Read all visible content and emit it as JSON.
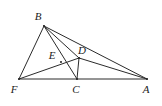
{
  "figure": {
    "kind": "geometry-diagram",
    "width": 162,
    "height": 106,
    "background_color": "#ffffff",
    "stroke_color": "#2b2b2b",
    "label_color": "#1c1c1c",
    "points": [
      {
        "id": "B",
        "label": "B",
        "x": 44,
        "y": 26,
        "label_x": 38,
        "label_y": 16
      },
      {
        "id": "F",
        "label": "F",
        "x": 19,
        "y": 79,
        "label_x": 14,
        "label_y": 89
      },
      {
        "id": "C",
        "label": "C",
        "x": 77,
        "y": 79,
        "label_x": 76,
        "label_y": 89
      },
      {
        "id": "A",
        "label": "A",
        "x": 147,
        "y": 79,
        "label_x": 146,
        "label_y": 89
      },
      {
        "id": "D",
        "label": "D",
        "x": 79,
        "y": 58,
        "label_x": 82,
        "label_y": 50
      },
      {
        "id": "E",
        "label": "E",
        "x": 61,
        "y": 62,
        "label_x": 52,
        "label_y": 55
      }
    ],
    "segments": [
      {
        "id": "FA",
        "from": "F",
        "to": "A",
        "name": "base-line-f-a"
      },
      {
        "id": "BF",
        "from": "B",
        "to": "F",
        "name": "segment-b-f"
      },
      {
        "id": "BC",
        "from": "B",
        "to": "C",
        "name": "segment-b-c"
      },
      {
        "id": "BD",
        "from": "B",
        "to": "D",
        "name": "segment-b-d"
      },
      {
        "id": "BA",
        "from": "B",
        "to": "A",
        "name": "segment-b-a"
      },
      {
        "id": "FD",
        "from": "F",
        "to": "D",
        "name": "segment-f-d"
      },
      {
        "id": "DC",
        "from": "D",
        "to": "C",
        "name": "segment-d-c"
      },
      {
        "id": "DA",
        "from": "D",
        "to": "A",
        "name": "segment-d-a"
      }
    ]
  }
}
